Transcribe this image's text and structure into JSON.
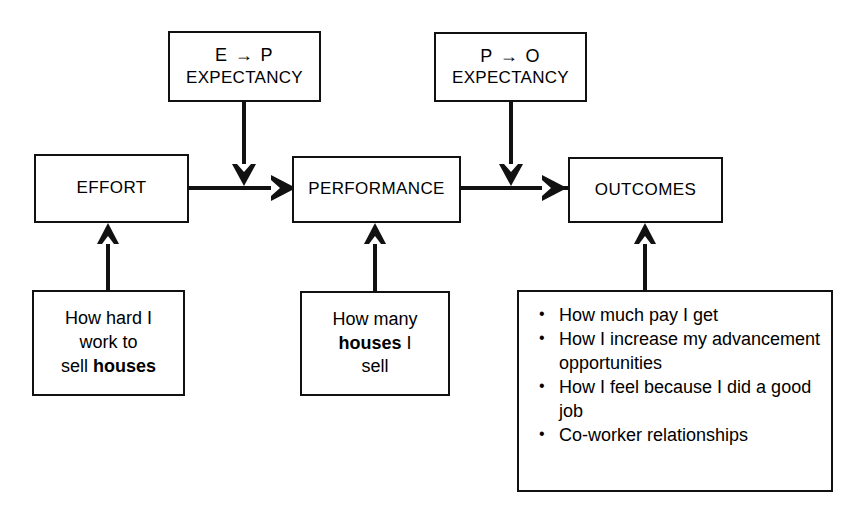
{
  "diagram": {
    "colors": {
      "stroke": "#111111",
      "background": "#ffffff",
      "text": "#000000"
    },
    "core_boxes": [
      {
        "id": "effort",
        "label": "EFFORT"
      },
      {
        "id": "performance",
        "label": "PERFORMANCE"
      },
      {
        "id": "outcomes",
        "label": "OUTCOMES"
      }
    ],
    "expectancy_boxes": [
      {
        "id": "e-to-p",
        "line1": "E → P",
        "line2": "EXPECTANCY"
      },
      {
        "id": "p-to-o",
        "line1": "P → O",
        "line2": "EXPECTANCY"
      }
    ],
    "example_boxes": [
      {
        "id": "effort-example",
        "lines": [
          "How hard I",
          "work to",
          "sell houses"
        ],
        "bold_words": [
          "houses"
        ]
      },
      {
        "id": "performance-example",
        "lines": [
          "How many",
          "houses I",
          "sell"
        ],
        "bold_words": [
          "houses"
        ]
      }
    ],
    "outcomes_list": {
      "id": "outcomes-example",
      "bullet_glyph": "•",
      "items": [
        "How much pay I get",
        "How I increase my advancement opportunities",
        "How I feel because I did a good job",
        "Co-worker relationships"
      ]
    },
    "connectors": [
      {
        "id": "effort-to-performance",
        "from": "EFFORT",
        "to": "PERFORMANCE",
        "direction": "right"
      },
      {
        "id": "performance-to-outcomes",
        "from": "PERFORMANCE",
        "to": "OUTCOMES",
        "direction": "right"
      },
      {
        "id": "e-to-p-expectancy-down",
        "from": "E → P EXPECTANCY",
        "to": "EFFORT → PERFORMANCE link",
        "direction": "down"
      },
      {
        "id": "p-to-o-expectancy-down",
        "from": "P → O EXPECTANCY",
        "to": "PERFORMANCE → OUTCOMES link",
        "direction": "down"
      },
      {
        "id": "effort-example-up",
        "from": "How hard I work to sell houses",
        "to": "EFFORT",
        "direction": "up"
      },
      {
        "id": "performance-example-up",
        "from": "How many houses I sell",
        "to": "PERFORMANCE",
        "direction": "up"
      },
      {
        "id": "outcomes-example-up",
        "from": "Outcomes list",
        "to": "OUTCOMES",
        "direction": "up"
      }
    ]
  }
}
